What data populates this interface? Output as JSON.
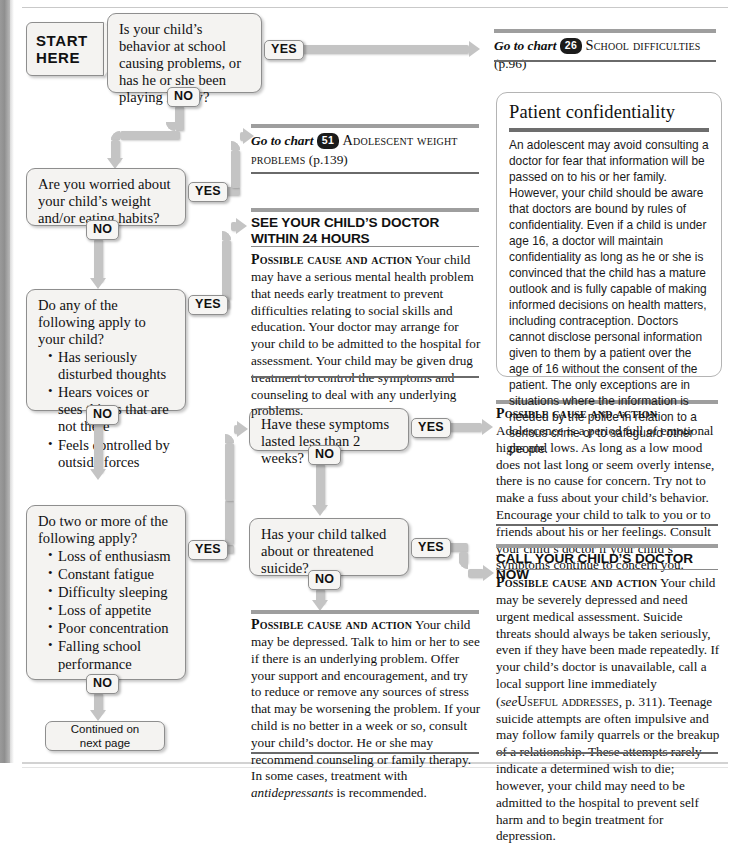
{
  "start": {
    "line1": "START",
    "line2": "HERE"
  },
  "labels": {
    "yes": "YES",
    "no": "NO"
  },
  "questions": {
    "q1": "Is your child’s behavior at school causing problems, or has he or she been playing hooky?",
    "q2": "Are you worried about your child’s weight and/or eating habits?",
    "q3_lead": "Do any of the following apply to your child?",
    "q3_items": [
      "Has seriously disturbed thoughts",
      "Hears voices or sees things that are not there",
      "Feels controlled by outside forces"
    ],
    "q4_lead": "Do two or more of the following apply?",
    "q4_items": [
      "Loss of enthusiasm",
      "Constant fatigue",
      "Difficulty sleeping",
      "Loss of appetite",
      "Poor concentration",
      "Falling school performance"
    ],
    "q5": "Have these symptoms lasted less than 2 weeks?",
    "q6": "Has your child talked about or threatened suicide?"
  },
  "references": {
    "school": {
      "prefix": "Go to chart",
      "number": "26",
      "title": "School difficulties",
      "page": "(p.96)"
    },
    "weight": {
      "prefix": "Go to chart",
      "number": "51",
      "title": "Adolescent weight problems",
      "page": "(p.139)"
    }
  },
  "advice": {
    "urgent24": {
      "heading": "SEE YOUR CHILD’S DOCTOR WITHIN 24 HOURS",
      "label": "Possible cause and action",
      "body": "Your child may have a serious mental health problem that needs early treatment to prevent difficulties relating to social skills and education. Your doctor may arrange for your child to be admitted to the hospital for assessment. Your child may be given drug treatment to control the symptoms and counseling to deal with any underlying problems."
    },
    "adolescence": {
      "label": "Possible cause and action",
      "body": "Adolescence is a period full of emotional highs and lows. As long as a low mood does not last long or seem overly intense, there is no cause for concern. Try not to make a fuss about your child’s behavior. Encourage your child to talk to you or to friends about his or her feelings. Consult your child’s doctor if your child’s symptoms continue to concern you."
    },
    "callnow": {
      "heading": "CALL YOUR CHILD’S DOCTOR NOW",
      "label": "Possible cause and action",
      "body_part1": "Your child may be severely depressed and need urgent medical assessment. Suicide threats should always be taken seriously, even if they have been made repeatedly. If your child’s doctor is unavailable, call a local support line immediately (",
      "body_see": "see",
      "body_ref": "Useful addresses",
      "body_part2": ", p. 311). Teenage suicide attempts are often impulsive and may follow family quarrels or the breakup of a relationship. These attempts rarely indicate a determined wish to die; however, your child may need to be admitted to the hospital to prevent self harm and to begin treatment for depression."
    },
    "depressed": {
      "label": "Possible cause and action",
      "body_part1": "Your child may be depressed. Talk to him or her to see if there is an underlying problem. Offer your support and encouragement, and try to reduce or remove any sources of stress that may be worsening the problem. If your child is no better in a week or so, consult your child’s doctor. He or she may recommend counseling or family therapy. In some cases, treatment with ",
      "body_ital": "antidepressants",
      "body_part2": " is recommended."
    }
  },
  "panel": {
    "title": "Patient confidentiality",
    "body": "An adolescent may avoid consulting a doctor for fear that information will be passed on to his or her family. However, your child should be aware that doctors are bound by rules of confidentiality. Even if a child is under age 16, a doctor will maintain confidentiality as long as he or she is convinced that the child has a mature outlook and is fully capable of making informed decisions on health matters, including contraception. Doctors cannot disclose personal information given to them by a patient over the age of 16 without the consent of the patient. The only exceptions are in situations where the information is needed by the police in relation to a serious crime or to safeguard other people."
  },
  "continued": {
    "line1": "Continued on",
    "line2": "next page"
  },
  "colors": {
    "connector": "#c4c4c4",
    "box_fill": "#f4f3f1",
    "box_border": "#8e8e8e",
    "rule_dark": "#6a6a6a",
    "rule_gray": "#9e9e9e",
    "badge": "#1b1b1b"
  }
}
